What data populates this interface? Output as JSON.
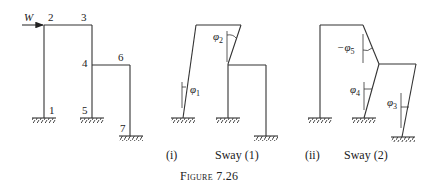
{
  "figure": {
    "caption": "Figure 7.26"
  },
  "original_frame": {
    "load_label": "W",
    "joints": [
      "1",
      "2",
      "3",
      "4",
      "5",
      "6",
      "7"
    ]
  },
  "sway_1": {
    "index_label": "(i)",
    "title": "Sway (1)",
    "angles": [
      {
        "symbol": "φ",
        "sub": "1"
      },
      {
        "symbol": "φ",
        "sub": "2"
      }
    ]
  },
  "sway_2": {
    "index_label": "(ii)",
    "title": "Sway (2)",
    "angles": [
      {
        "symbol": "φ",
        "sub": "3"
      },
      {
        "symbol": "φ",
        "sub": "4"
      },
      {
        "symbol": "−φ",
        "sub": "5"
      }
    ]
  },
  "colors": {
    "line": "#333333",
    "text": "#222222",
    "background": "#ffffff"
  }
}
